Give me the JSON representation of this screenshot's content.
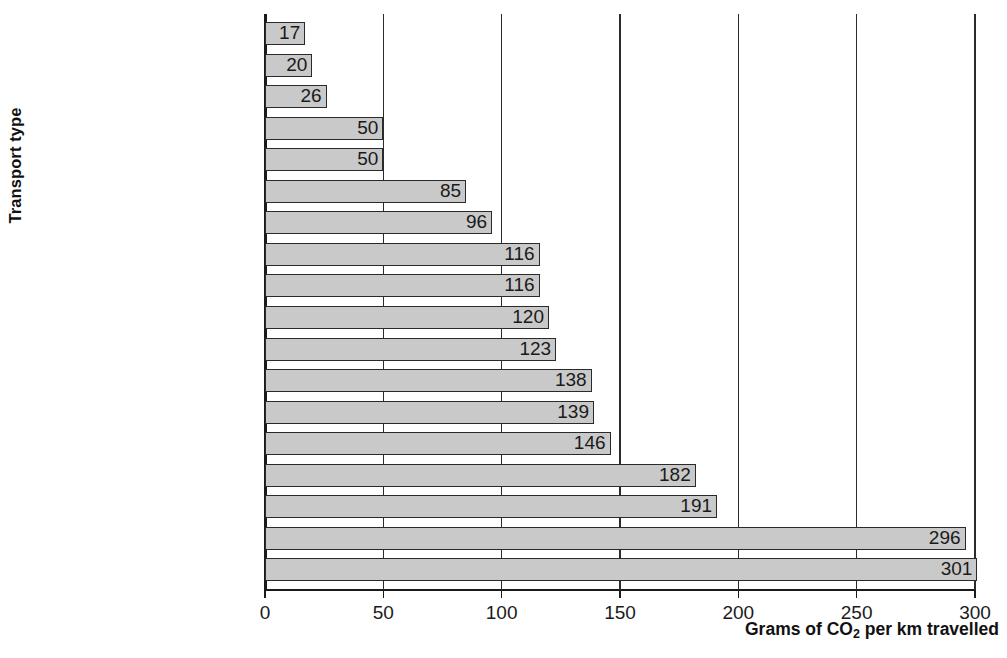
{
  "chart_data": {
    "type": "bar",
    "orientation": "horizontal",
    "title": "",
    "xlabel": "Grams of CO2 per km travelled",
    "xlabel_display": "Grams of CO",
    "xlabel_sub": "2",
    "xlabel_tail": " per km travelled",
    "ylabel": "Transport type",
    "xlim": [
      0,
      300
    ],
    "xticks": [
      0,
      50,
      100,
      150,
      200,
      250,
      300
    ],
    "xticklabels": [
      "0",
      "50",
      "100",
      "150",
      "200",
      "250",
      "300"
    ],
    "grid": "vertical gridlines at each x tick",
    "legend": "none",
    "categories": [
      "Cycling",
      "Passenger rail",
      "School bus",
      "Electric car (solar)",
      "Metro/Underground",
      "Coach",
      "Scooter (80 mpg)",
      "Hybrid car (45 mpg)",
      "Rail freight",
      "Short flight (economy)",
      "Electric car",
      "Small car (35 mpg)",
      "Long flight (economy)",
      "Motorbike (50 mpg)",
      "Local bus",
      "Medium car (25 mpg)",
      "Long flight (business)",
      "Large car (15 mpg)"
    ],
    "values": [
      17,
      20,
      26,
      50,
      50,
      85,
      96,
      116,
      116,
      120,
      123,
      138,
      139,
      146,
      182,
      191,
      296,
      301
    ],
    "value_labels": [
      "17",
      "20",
      "26",
      "50",
      "50",
      "85",
      "96",
      "116",
      "116",
      "120",
      "123",
      "138",
      "139",
      "146",
      "182",
      "191",
      "296",
      "301"
    ],
    "colors": {
      "bar_fill": "#c9c9c9",
      "bar_edge": "#2a2a2a",
      "axis": "#1a1a1a",
      "grid": "#2b2b2b",
      "text": "#1a1a1a",
      "background": "#ffffff"
    }
  }
}
